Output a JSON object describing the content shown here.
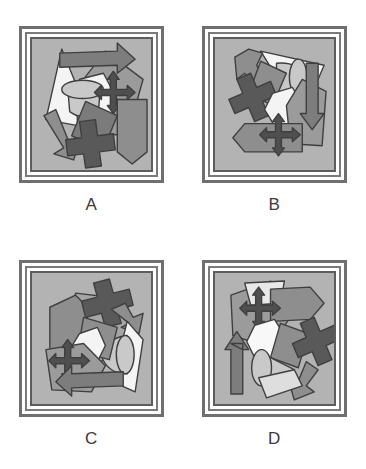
{
  "figure": {
    "type": "spatial-rotation-multiple-choice",
    "background_color": "#ffffff",
    "panel_count": 4
  },
  "palette": {
    "frame_outer": "#6f6f6f",
    "frame_mid": "#7a7a7a",
    "frame_inner": "#5d5d5d",
    "frame_gap": "#ffffff",
    "panel_background": "#b3b3b3",
    "outline": "#3f3f3f",
    "shape_dark": "#595959",
    "shape_mid": "#8e8e8e",
    "shape_light": "#c9c9c9",
    "shape_white": "#f4f4f4",
    "shape_arrow": "#7d7d7d",
    "label_text": "#3a3a3a"
  },
  "shape_legend": [
    {
      "key": "cross",
      "name": "plus-cross-block",
      "fill": "#595959"
    },
    {
      "key": "cone",
      "name": "cone-solid",
      "fill": "#c9c9c9"
    },
    {
      "key": "triangle",
      "name": "triangle-wedge",
      "fill": "#f4f4f4"
    },
    {
      "key": "pentagon",
      "name": "pentagon-arrow-block",
      "fill": "#8e8e8e"
    },
    {
      "key": "block-arrow",
      "name": "block-arrow",
      "fill": "#7d7d7d"
    },
    {
      "key": "four-way",
      "name": "four-way-arrow",
      "fill": "#595959"
    },
    {
      "key": "diamond",
      "name": "diamond-plate",
      "fill": "#8e8e8e"
    },
    {
      "key": "bent-arrow",
      "name": "bent-arrow",
      "fill": "#8e8e8e"
    }
  ],
  "panels": [
    {
      "id": "a",
      "label": "A",
      "name": "option-panel-a",
      "rotation_deg": 0,
      "contents": [
        "triangle",
        "cone",
        "block-arrow",
        "four-way",
        "cross",
        "pentagon",
        "diamond",
        "bent-arrow"
      ]
    },
    {
      "id": "b",
      "label": "B",
      "name": "option-panel-b",
      "rotation_deg": 90,
      "contents": [
        "triangle",
        "cone",
        "block-arrow",
        "four-way",
        "cross",
        "pentagon",
        "diamond",
        "bent-arrow"
      ]
    },
    {
      "id": "c",
      "label": "C",
      "name": "option-panel-c",
      "rotation_deg": 180,
      "contents": [
        "triangle",
        "cone",
        "block-arrow",
        "four-way",
        "cross",
        "pentagon",
        "diamond",
        "bent-arrow"
      ]
    },
    {
      "id": "d",
      "label": "D",
      "name": "option-panel-d",
      "rotation_deg": 270,
      "contents": [
        "triangle",
        "cone",
        "block-arrow",
        "four-way",
        "cross",
        "pentagon",
        "diamond",
        "bent-arrow"
      ]
    }
  ]
}
